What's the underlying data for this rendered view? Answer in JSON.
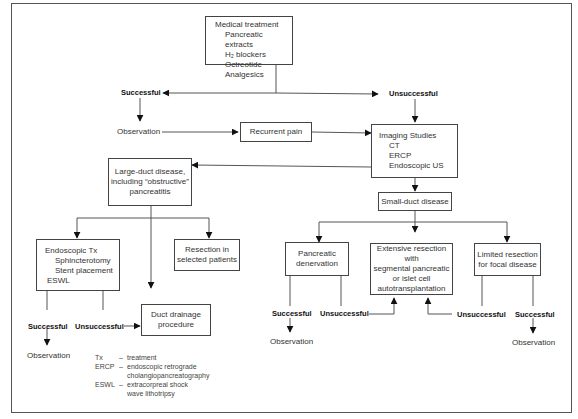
{
  "medical": {
    "title": "Medical treatment",
    "items": [
      "Pancreatic extracts",
      "H₂ blockers",
      "Octreotide",
      "Analgesics"
    ]
  },
  "outcomes": {
    "top_successful": "Successful",
    "top_unsuccessful": "Unsuccessful",
    "observation_top": "Observation"
  },
  "recurrent_pain": "Recurrent pain",
  "imaging": {
    "title": "Imaging Studies",
    "items": [
      "CT",
      "ERCP",
      "Endoscopic US"
    ]
  },
  "large_duct": {
    "line1": "Large-duct disease,",
    "line2": "including “obstructive”",
    "line3": "pancreatitis"
  },
  "small_duct": "Small-duct disease",
  "endoscopic": {
    "title": "Endoscopic Tx",
    "items": [
      "Sphincterotomy",
      "Stent placement",
      "ESWL"
    ]
  },
  "resection_selected": {
    "line1": "Resection in",
    "line2": "selected patients"
  },
  "duct_drainage": {
    "line1": "Duct drainage",
    "line2": "procedure"
  },
  "pancreatic_denervation": {
    "line1": "Pancreatic",
    "line2": "denervation"
  },
  "extensive_resection": {
    "line1": "Extensive resection with",
    "line2": "segmental pancreatic",
    "line3": "or islet cell",
    "line4": "autotransplantation"
  },
  "limited_resection": {
    "line1": "Limited resection",
    "line2": "for focal disease"
  },
  "branch_labels": {
    "endo_successful": "Successful",
    "endo_unsuccessful": "Unsuccessful",
    "endo_observation": "Observation",
    "den_successful": "Successful",
    "den_unsuccessful": "Unsuccessful",
    "den_observation": "Observation",
    "lim_unsuccessful": "Unsuccessful",
    "lim_successful": "Successful",
    "lim_observation": "Observation"
  },
  "legend": [
    {
      "abbr": "Tx",
      "def": "treatment"
    },
    {
      "abbr": "ERCP",
      "def": "endoscopic retrograde",
      "def2": "cholangiopancreatography"
    },
    {
      "abbr": "ESWL",
      "def": "extracorpreal shock",
      "def2": "wave lithotripsy"
    }
  ],
  "legend_dash": "–"
}
